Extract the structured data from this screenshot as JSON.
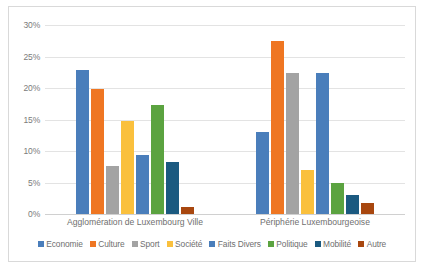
{
  "chart_data": {
    "type": "bar",
    "title": "",
    "xlabel": "",
    "ylabel": "",
    "ylim": [
      0,
      30
    ],
    "ytick_labels": [
      "30%",
      "25%",
      "20%",
      "15%",
      "10%",
      "5%",
      "0%"
    ],
    "ytick_values": [
      30,
      25,
      20,
      15,
      10,
      5,
      0
    ],
    "grid": true,
    "legend_position": "bottom",
    "categories": [
      "Agglomération de Luxembourg Ville",
      "Périphérie Luxembourgeoise"
    ],
    "series": [
      {
        "name": "Economie",
        "color": "#4a7ebb",
        "values": [
          22.8,
          13.0
        ]
      },
      {
        "name": "Culture",
        "color": "#ef7622",
        "values": [
          19.8,
          27.5
        ]
      },
      {
        "name": "Sport",
        "color": "#a3a3a3",
        "values": [
          7.6,
          22.4
        ]
      },
      {
        "name": "Société",
        "color": "#fac03d",
        "values": [
          14.8,
          7.0
        ]
      },
      {
        "name": "Faits Divers",
        "color": "#4a7ebb",
        "values": [
          9.3,
          22.4
        ]
      },
      {
        "name": "Politique",
        "color": "#5ba340",
        "values": [
          17.3,
          5.0
        ]
      },
      {
        "name": "Mobilité",
        "color": "#1b5a80",
        "values": [
          8.2,
          3.0
        ]
      },
      {
        "name": "Autre",
        "color": "#a8470f",
        "values": [
          1.1,
          1.7
        ]
      }
    ]
  }
}
